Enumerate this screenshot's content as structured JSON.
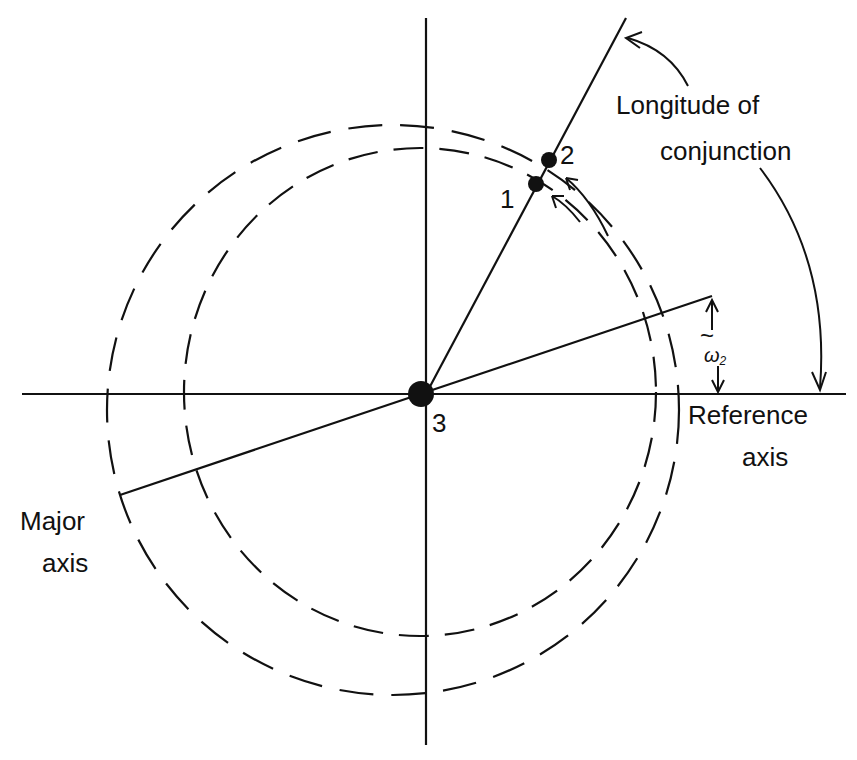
{
  "diagram": {
    "labels": {
      "body1": "1",
      "body2": "2",
      "body3": "3",
      "longitude_line1": "Longitude of",
      "longitude_line2": "conjunction",
      "reference_line1": "Reference",
      "reference_line2": "axis",
      "major_line1": "Major",
      "major_line2": "axis",
      "omega_tilde": "~",
      "omega": "ω",
      "omega_sub": "2"
    },
    "colors": {
      "ink": "#111111",
      "background": "#ffffff"
    }
  }
}
